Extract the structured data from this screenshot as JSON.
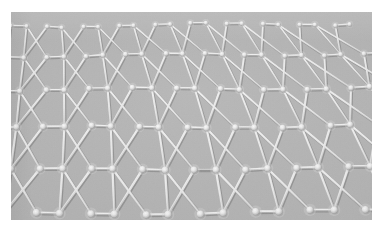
{
  "image": {
    "kind": "scanning-probe-micrograph",
    "subject": "honeycomb-lattice",
    "canvas": {
      "width": 383,
      "height": 227,
      "background_color": "#ffffff"
    },
    "panel": {
      "left": 11,
      "top": 12,
      "width": 361,
      "height": 208,
      "background_color": "#b4b4b4",
      "noise_opacity": 0.5
    },
    "palette": {
      "page_background": "#ffffff",
      "lattice_background": "#b4b4b4",
      "cell_fill": "#b3b3b3",
      "bond_highlight": "#ededed",
      "bond_core": "#dcdcdc",
      "bond_shadow": "#8e8e8e",
      "node_core": "#f2f2f2",
      "node_rim": "#9a9a9a",
      "node_glow": "#d8d8d8"
    },
    "lattice": {
      "type": "honeycomb",
      "orientation": "flat-top-horizontal-bonds",
      "columns": 9,
      "rows": 6,
      "cell_period_x_top": 45,
      "cell_period_x_bottom": 58,
      "row_period_y_top": 30,
      "row_period_y_bottom": 44,
      "row_slope_px": -9,
      "perspective_scale_top": 0.82,
      "perspective_scale_bottom": 1.18,
      "bond_width_top": 1.6,
      "bond_width_bottom": 2.4,
      "node_radius_top": 2.2,
      "node_radius_bottom": 3.4,
      "row_y_centers": [
        14,
        44,
        78,
        116,
        158,
        202
      ],
      "row_x_offsets": [
        0,
        -4,
        -9,
        -15,
        -22,
        -30
      ],
      "row_scales": [
        0.8,
        0.88,
        0.97,
        1.06,
        1.14,
        1.22
      ]
    },
    "texture": {
      "grain": "fine-gaussian",
      "grain_strength": 0.06,
      "emboss_light_direction": "top-left"
    }
  }
}
